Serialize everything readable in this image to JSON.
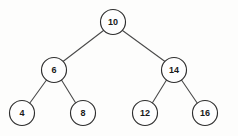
{
  "figure": {
    "kind": "binary-search-tree-diagram",
    "background_color": "#fdfdfc",
    "node_fill_color": "#fefefe",
    "node_stroke_color": "#2e2e2e",
    "edge_color": "#4a4a4a",
    "label_color": "#1a1a1a"
  },
  "tree": {
    "nodes": [
      {
        "id": "n10",
        "label": "10",
        "cx": 113,
        "cy": 22,
        "r": 12.5,
        "level": 0,
        "role": "root"
      },
      {
        "id": "n6",
        "label": "6",
        "cx": 54,
        "cy": 70,
        "r": 12.5,
        "level": 1,
        "role": "left-child"
      },
      {
        "id": "n14",
        "label": "14",
        "cx": 174,
        "cy": 70,
        "r": 12.5,
        "level": 1,
        "role": "right-child"
      },
      {
        "id": "n4",
        "label": "4",
        "cx": 22,
        "cy": 113,
        "r": 12.5,
        "level": 2,
        "role": "leaf"
      },
      {
        "id": "n8",
        "label": "8",
        "cx": 83,
        "cy": 113,
        "r": 12.5,
        "level": 2,
        "role": "leaf"
      },
      {
        "id": "n12",
        "label": "12",
        "cx": 145,
        "cy": 113,
        "r": 12.5,
        "level": 2,
        "role": "leaf"
      },
      {
        "id": "n16",
        "label": "16",
        "cx": 205,
        "cy": 113,
        "r": 12.5,
        "level": 2,
        "role": "leaf"
      }
    ],
    "edges": [
      {
        "id": "e10-6",
        "from": "n10",
        "to": "n6",
        "x1": 103.5,
        "y1": 30.5,
        "x2": 63.0,
        "y2": 61.5
      },
      {
        "id": "e10-14",
        "from": "n10",
        "to": "n14",
        "x1": 122.5,
        "y1": 30.5,
        "x2": 165.0,
        "y2": 61.5
      },
      {
        "id": "e6-4",
        "from": "n6",
        "to": "n4",
        "x1": 46.5,
        "y1": 80.0,
        "x2": 29.5,
        "y2": 103.5
      },
      {
        "id": "e6-8",
        "from": "n6",
        "to": "n8",
        "x1": 61.5,
        "y1": 80.0,
        "x2": 76.0,
        "y2": 103.5
      },
      {
        "id": "e14-12",
        "from": "n14",
        "to": "n12",
        "x1": 166.5,
        "y1": 80.0,
        "x2": 152.0,
        "y2": 103.5
      },
      {
        "id": "e14-16",
        "from": "n14",
        "to": "n16",
        "x1": 181.5,
        "y1": 80.0,
        "x2": 197.5,
        "y2": 103.5
      }
    ]
  }
}
